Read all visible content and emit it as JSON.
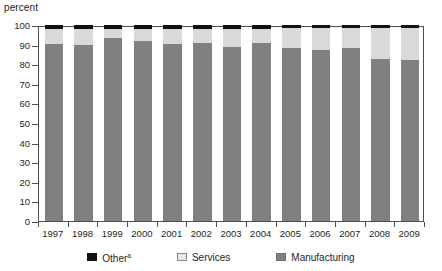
{
  "chart_data": {
    "type": "bar",
    "title": "",
    "subtitle": "",
    "ylabel": "percent",
    "xlabel": "",
    "ylim": [
      0,
      100
    ],
    "yticks": [
      0,
      10,
      20,
      30,
      40,
      50,
      60,
      70,
      80,
      90,
      100
    ],
    "grid": false,
    "stacked": true,
    "legend_position": "bottom",
    "categories": [
      "1997",
      "1998",
      "1999",
      "2000",
      "2001",
      "2002",
      "2003",
      "2004",
      "2005",
      "2006",
      "2007",
      "2008",
      "2009"
    ],
    "series": [
      {
        "name": "Manufacturing",
        "color": "#808080",
        "values": [
          90.2,
          90.0,
          93.2,
          91.8,
          90.5,
          91.0,
          88.8,
          91.0,
          88.3,
          87.3,
          88.5,
          82.5,
          82.0
        ]
      },
      {
        "name": "Services",
        "color": "#d9d9d9",
        "values": [
          7.6,
          8.0,
          5.0,
          6.4,
          7.6,
          7.2,
          9.4,
          7.2,
          10.0,
          11.0,
          9.8,
          16.0,
          16.6
        ]
      },
      {
        "name": "Other",
        "color": "#111111",
        "values": [
          2.2,
          2.0,
          1.8,
          1.8,
          1.9,
          1.8,
          1.8,
          1.8,
          1.7,
          1.7,
          1.7,
          1.5,
          1.4
        ]
      }
    ]
  },
  "axis": {
    "y_title": "percent",
    "y_tick_labels": [
      "100",
      "90",
      "80",
      "70",
      "60",
      "50",
      "40",
      "30",
      "20",
      "10",
      "0"
    ],
    "x_tick_labels": [
      "1997",
      "1998",
      "1999",
      "2000",
      "2001",
      "2002",
      "2003",
      "2004",
      "2005",
      "2006",
      "2007",
      "2008",
      "2009"
    ]
  },
  "legend": {
    "items": [
      {
        "label": "Other",
        "superscript": "a",
        "swatch": "other"
      },
      {
        "label": "Services",
        "superscript": "",
        "swatch": "services"
      },
      {
        "label": "Manufacturing",
        "superscript": "",
        "swatch": "manufacturing"
      }
    ]
  },
  "colors": {
    "manufacturing": "#808080",
    "services": "#d9d9d9",
    "other": "#111111",
    "axis": "#4d4d4d",
    "text": "#231f20",
    "background": "#ffffff"
  }
}
